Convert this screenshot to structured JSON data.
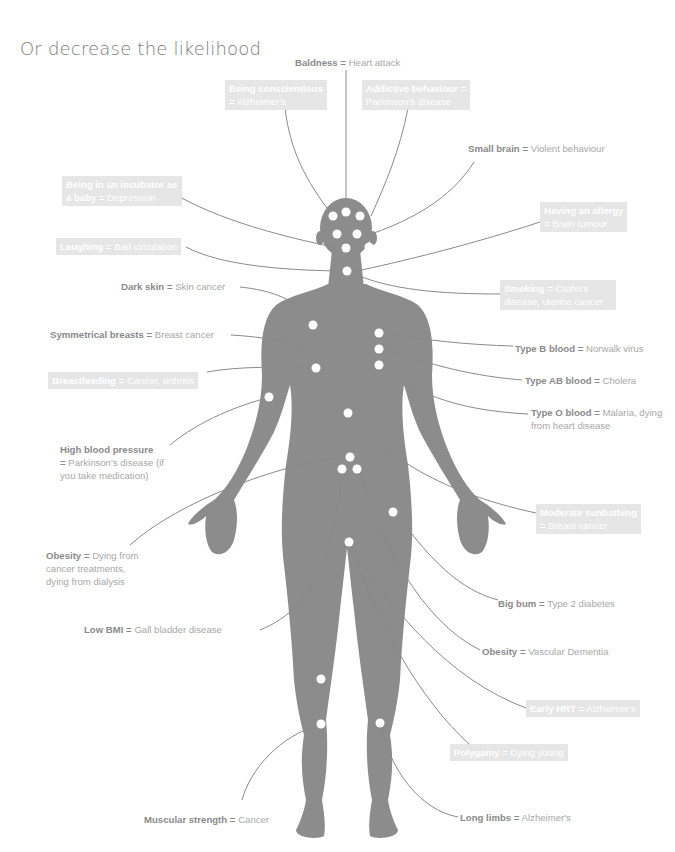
{
  "title": "Or decrease the likelihood",
  "colors": {
    "body": "#8c8c8c",
    "dot": "#ffffff",
    "line": "#8a8a8a",
    "box_bg": "#e6e6e6",
    "label_bold": "#8a8a8a",
    "label_light": "#a8a8a8"
  },
  "labels": [
    {
      "id": "baldness",
      "cause": "Baldness",
      "eq": "=",
      "effect": "Heart attack",
      "style": "plain"
    },
    {
      "id": "conscientious",
      "cause": "Being conscientious",
      "eq": "=",
      "effect": "Alzheimer's",
      "style": "box"
    },
    {
      "id": "addictive",
      "cause": "Addictive behaviour",
      "eq": "=",
      "effect": "Parkinson's disease",
      "style": "box"
    },
    {
      "id": "small-brain",
      "cause": "Small brain",
      "eq": "=",
      "effect": "Violent behaviour",
      "style": "plain"
    },
    {
      "id": "incubator",
      "cause": "Being in an incubator as a baby",
      "eq": "=",
      "effect": "Depression",
      "style": "box"
    },
    {
      "id": "allergy",
      "cause": "Having an allergy",
      "eq": "=",
      "effect": "Brain tumour",
      "style": "box"
    },
    {
      "id": "laughing",
      "cause": "Laughing",
      "eq": "=",
      "effect": "Bad circulation",
      "style": "box"
    },
    {
      "id": "smoking",
      "cause": "Smoking",
      "eq": "=",
      "effect": "Crohn's disease, uterine cancer",
      "style": "box"
    },
    {
      "id": "dark-skin",
      "cause": "Dark skin",
      "eq": "=",
      "effect": "Skin cancer",
      "style": "plain"
    },
    {
      "id": "symmetrical",
      "cause": "Symmetrical breasts",
      "eq": "=",
      "effect": "Breast cancer",
      "style": "plain"
    },
    {
      "id": "type-b",
      "cause": "Type B blood",
      "eq": "=",
      "effect": "Norwalk virus",
      "style": "plain"
    },
    {
      "id": "breastfeeding",
      "cause": "Breastfeeding",
      "eq": "=",
      "effect": "Cancer, arthritis",
      "style": "box"
    },
    {
      "id": "type-ab",
      "cause": "Type AB blood",
      "eq": "=",
      "effect": "Cholera",
      "style": "plain"
    },
    {
      "id": "type-o",
      "cause": "Type O blood",
      "eq": "=",
      "effect": "Malaria, dying from heart disease",
      "style": "plain"
    },
    {
      "id": "high-bp",
      "cause": "High blood pressure",
      "eq": "=",
      "effect": "Parkinson's disease (if you take medication)",
      "style": "plain"
    },
    {
      "id": "sunbathing",
      "cause": "Moderate sunbathing",
      "eq": "=",
      "effect": "Breast cancer",
      "style": "box"
    },
    {
      "id": "obesity-dying",
      "cause": "Obesity",
      "eq": "=",
      "effect": "Dying from cancer treatments, dying from dialysis",
      "style": "plain"
    },
    {
      "id": "big-bum",
      "cause": "Big bum",
      "eq": "=",
      "effect": "Type 2 diabetes",
      "style": "plain"
    },
    {
      "id": "low-bmi",
      "cause": "Low BMI",
      "eq": "=",
      "effect": "Gall bladder disease",
      "style": "plain"
    },
    {
      "id": "obesity-dementia",
      "cause": "Obesity",
      "eq": "=",
      "effect": "Vascular Dementia",
      "style": "plain"
    },
    {
      "id": "early-hrt",
      "cause": "Early HRT",
      "eq": "=",
      "effect": "Alzheimer's",
      "style": "box"
    },
    {
      "id": "polygamy",
      "cause": "Polygamy",
      "eq": "=",
      "effect": "Dying young",
      "style": "box"
    },
    {
      "id": "muscular",
      "cause": "Muscular strength",
      "eq": "=",
      "effect": "Cancer",
      "style": "plain"
    },
    {
      "id": "long-limbs",
      "cause": "Long limbs",
      "eq": "=",
      "effect": "Alzheimer's",
      "style": "plain"
    }
  ]
}
